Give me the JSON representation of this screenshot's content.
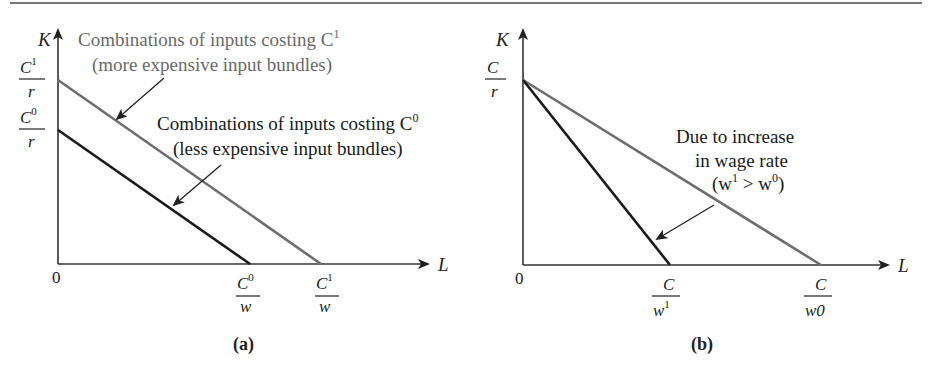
{
  "figure": {
    "panels": [
      {
        "id": "a",
        "caption": "(a)",
        "y_axis_label": "K",
        "x_axis_label": "L",
        "origin_label": "0",
        "y_ticks": [
          {
            "num": "C",
            "sup": "1",
            "den": "r"
          },
          {
            "num": "C",
            "sup": "0",
            "den": "r"
          }
        ],
        "x_ticks": [
          {
            "num": "C",
            "sup": "0",
            "den": "w"
          },
          {
            "num": "C",
            "sup": "1",
            "den": "w"
          }
        ],
        "annotations": [
          {
            "line1": "Combinations of inputs costing C",
            "line1_sup": "1",
            "line2": "(more expensive input bundles)",
            "color": "#6a6a6a"
          },
          {
            "line1": "Combinations of inputs costing C",
            "line1_sup": "0",
            "line2": "(less expensive input bundles)",
            "color": "#1a1a1a"
          }
        ]
      },
      {
        "id": "b",
        "caption": "(b)",
        "y_axis_label": "K",
        "x_axis_label": "L",
        "origin_label": "0",
        "y_ticks": [
          {
            "num": "C",
            "sup": "",
            "den": "r"
          }
        ],
        "x_ticks": [
          {
            "num": "C",
            "den": "w",
            "den_sup": "1"
          },
          {
            "num": "C",
            "den": "w",
            "den_sup": "0"
          }
        ],
        "annotations": [
          {
            "line1": "Due to increase",
            "line2": "in wage rate",
            "line3_a": "(w",
            "line3_sup1": "1",
            "line3_b": " > w",
            "line3_sup2": "0",
            "line3_c": ")"
          }
        ]
      }
    ],
    "colors": {
      "gray_line": "#6e6e6e",
      "dark_line": "#1a1a1a",
      "axis": "#333333"
    }
  }
}
